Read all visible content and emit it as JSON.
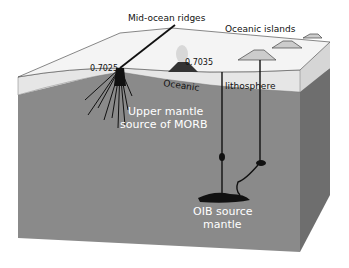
{
  "diagram": {
    "labels": {
      "mid_ocean_ridges": "Mid-ocean ridges",
      "oceanic_islands": "Oceanic islands",
      "ratio_ridge": "0.7025",
      "ratio_island": "0.7035",
      "oceanic": "Oceanic",
      "lithosphere": "lithosphere",
      "upper_mantle_line1": "Upper mantle",
      "upper_mantle_line2": "source of MORB",
      "oib_line1": "OIB source",
      "oib_line2": "mantle"
    },
    "colors": {
      "ocean_surface": "#f2f2f2",
      "lithosphere_band": "#e4e4e4",
      "mantle_front": "#8a8a8a",
      "mantle_side": "#6e6e6e",
      "right_side_top": "#c8c8c8",
      "magma": "#111111",
      "white_text": "#ffffff"
    }
  }
}
